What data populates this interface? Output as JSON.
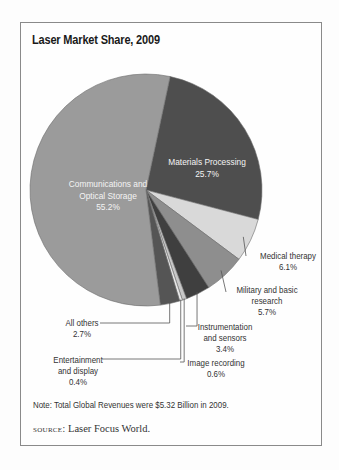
{
  "chart": {
    "title": "Laser Market Share, 2009",
    "note": "Note: Total Global Revenues were $5.32 Billion in 2009.",
    "source_label": "source:",
    "source_text": "Laser Focus World.",
    "labels": {
      "communications": [
        "Communications and",
        "Optical Storage",
        "55.2%"
      ],
      "materials": [
        "Materials Processing",
        "25.7%"
      ],
      "medical": [
        "Medical therapy",
        "6.1%"
      ],
      "military": [
        "Military and basic",
        "research",
        "5.7%"
      ],
      "instrumentation": [
        "Instrumentation",
        "and sensors",
        "3.4%"
      ],
      "image": [
        "Image recording",
        "0.6%"
      ],
      "entertainment": [
        "Entertainment",
        "and display",
        "0.4%"
      ],
      "others": [
        "All others",
        "2.7%"
      ]
    }
  },
  "chart_data": {
    "type": "pie",
    "title": "Laser Market Share, 2009",
    "categories": [
      "Materials Processing",
      "Medical therapy",
      "Military and basic research",
      "Instrumentation and sensors",
      "Image recording",
      "Entertainment and display",
      "All others",
      "Communications and Optical Storage"
    ],
    "values": [
      25.7,
      6.1,
      5.7,
      3.4,
      0.6,
      0.4,
      2.7,
      55.2
    ],
    "unit": "%",
    "colors": [
      "#4e4e4e",
      "#d9d9d9",
      "#8e8e8e",
      "#3f3f3f",
      "#c8c8c8",
      "#e8e8e8",
      "#555555",
      "#9b9b9b"
    ],
    "start_angle_deg": 12,
    "direction": "clockwise",
    "note": "Note: Total Global Revenues were $5.32 Billion in 2009.",
    "source": "Laser Focus World.",
    "legend": "none (direct labels)"
  }
}
